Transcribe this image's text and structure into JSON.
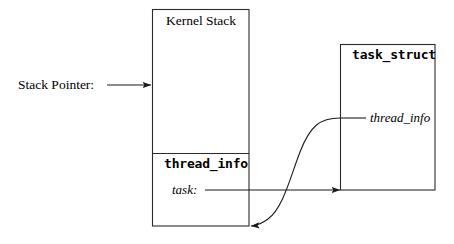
{
  "diagram": {
    "background_color": "#ffffff",
    "line_color": "#000000",
    "text_color": "#000000",
    "labels": {
      "stack_pointer": "Stack Pointer:",
      "kernel_stack": "Kernel Stack",
      "thread_info_box": "thread_info",
      "task_field": "task:",
      "task_struct": "task_struct",
      "thread_info_pointer": "thread_info"
    },
    "boxes": [
      {
        "name": "kernel-stack-box",
        "label": "Kernel Stack",
        "x": 152,
        "y": 9,
        "width": 97,
        "height": 217,
        "divider_y": 153,
        "sections": [
          "Kernel Stack",
          "thread_info"
        ]
      },
      {
        "name": "task-struct-box",
        "label": "task_struct",
        "x": 340,
        "y": 44,
        "width": 95,
        "height": 146
      }
    ],
    "connectors": [
      {
        "name": "stack-pointer-arrow",
        "from": "Stack Pointer:",
        "to": "kernel-stack-box left edge",
        "kind": "straight",
        "x1": 108,
        "y1": 85,
        "x2": 152,
        "y2": 85,
        "arrow_at": "end"
      },
      {
        "name": "task-pointer-arrow",
        "from": "task:",
        "to": "task-struct-box bottom-left corner",
        "kind": "straight",
        "x1": 205,
        "y1": 190,
        "x2": 340,
        "y2": 190,
        "arrow_at": "end"
      },
      {
        "name": "thread-info-back-pointer-curve",
        "from": "task_struct thread_info field",
        "to": "kernel-stack-box bottom-right corner",
        "kind": "s-curve",
        "x1": 365,
        "y1": 118,
        "x2": 249,
        "y2": 226,
        "arrow_at": "end"
      }
    ]
  }
}
